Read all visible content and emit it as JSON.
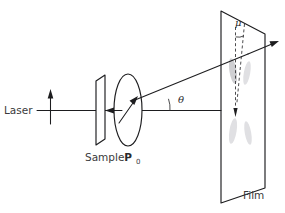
{
  "figure": {
    "kind": "optical-light-scattering-diagram",
    "background_color": "#ffffff",
    "ink_color": "#1d1d1f",
    "text_color": "#3a3a3c"
  },
  "labels": {
    "laser": "Laser",
    "sample": "Sample",
    "polarization_symbol": "P",
    "polarization_subscript": "0",
    "film": "Film",
    "scattering_angle": "θ",
    "azimuth_angle": "μ"
  },
  "components": [
    {
      "name": "laser-source",
      "label": "Laser",
      "description": "incident beam entering from the left along the horizontal optical axis"
    },
    {
      "name": "polarization-arrow",
      "label": "",
      "description": "vertical arrow on the incident beam indicating vertical polarization"
    },
    {
      "name": "sample-plate",
      "label": "Sample",
      "description": "slanted rectangular plate intersected by the beam"
    },
    {
      "name": "analyzer-ellipse",
      "label": "P0",
      "description": "elliptical polarizer disc with internal diagonal transmission-axis arrow"
    },
    {
      "name": "film-plane",
      "label": "Film",
      "description": "large tilted detection plane recording the scattering pattern"
    }
  ],
  "rays": [
    {
      "name": "incident-beam",
      "description": "horizontal ray from laser through sample and analyzer to film"
    },
    {
      "name": "scattered-ray",
      "description": "ray leaving the analyzer at angle theta, striking and passing through the film"
    }
  ],
  "angles": [
    {
      "name": "theta",
      "symbol": "θ",
      "description": "scattering angle between the incident optical axis and the scattered ray"
    },
    {
      "name": "mu",
      "symbol": "μ",
      "description": "azimuthal angle on the film plane between the vertical reference and the scattering lobe"
    }
  ]
}
